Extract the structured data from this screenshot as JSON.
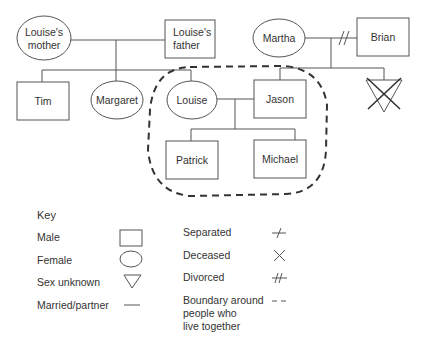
{
  "genogram": {
    "people": {
      "louises_mother": {
        "line1": "Louise's",
        "line2": "mother",
        "sex": "female"
      },
      "louises_father": {
        "line1": "Louise's",
        "line2": "father",
        "sex": "male"
      },
      "martha": {
        "label": "Martha",
        "sex": "female"
      },
      "brian": {
        "label": "Brian",
        "sex": "male"
      },
      "tim": {
        "label": "Tim",
        "sex": "male"
      },
      "margaret": {
        "label": "Margaret",
        "sex": "female"
      },
      "louise": {
        "label": "Louise",
        "sex": "female"
      },
      "jason": {
        "label": "Jason",
        "sex": "male"
      },
      "unknown_deceased": {
        "label": "",
        "sex": "unknown",
        "deceased": true
      },
      "patrick": {
        "label": "Patrick",
        "sex": "male"
      },
      "michael": {
        "label": "Michael",
        "sex": "male"
      }
    },
    "relationships": [
      {
        "partners": [
          "louises_mother",
          "louises_father"
        ],
        "type": "married"
      },
      {
        "partners": [
          "martha",
          "brian"
        ],
        "type": "divorced"
      },
      {
        "partners": [
          "louise",
          "jason"
        ],
        "type": "married"
      }
    ],
    "household_boundary": [
      "louise",
      "jason",
      "patrick",
      "michael"
    ]
  },
  "key": {
    "title": "Key",
    "items": [
      {
        "label": "Male",
        "symbol": "square"
      },
      {
        "label": "Female",
        "symbol": "circle"
      },
      {
        "label": "Sex unknown",
        "symbol": "triangle-down"
      },
      {
        "label": "Married/partner",
        "symbol": "line"
      },
      {
        "label": "Separated",
        "symbol": "single-slash"
      },
      {
        "label": "Deceased",
        "symbol": "cross"
      },
      {
        "label": "Divorced",
        "symbol": "double-slash"
      },
      {
        "label_lines": [
          "Boundary around",
          "people who",
          "live together"
        ],
        "symbol": "dashes"
      }
    ]
  }
}
